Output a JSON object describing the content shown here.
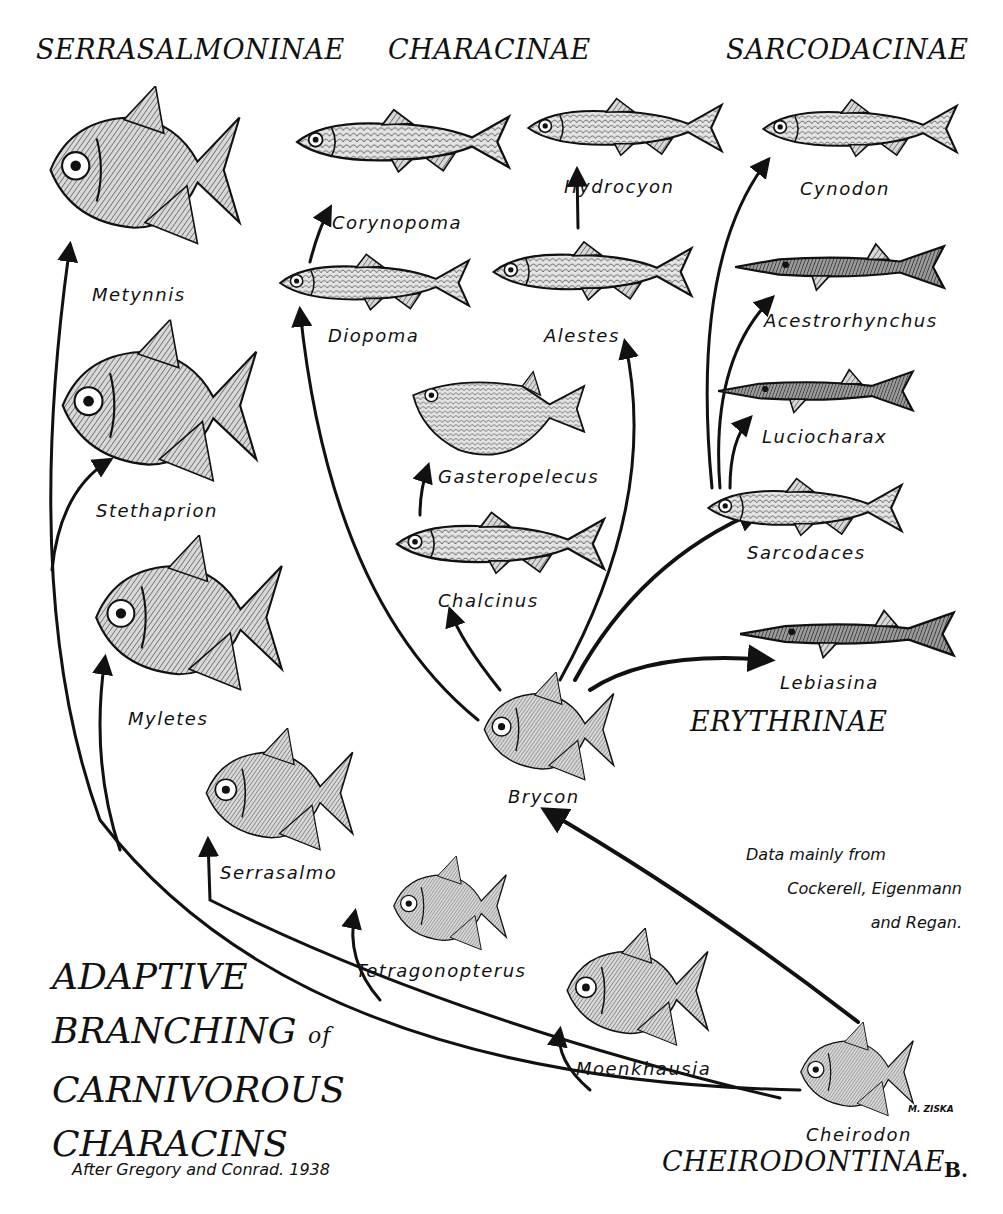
{
  "title": {
    "lines": [
      "ADAPTIVE",
      "BRANCHING",
      "of",
      "CARNIVOROUS",
      "CHARACINS"
    ],
    "credit": "After Gregory and Conrad. 1938"
  },
  "source_note": [
    "Data mainly from",
    "Cockerell, Eigenmann",
    "and Regan."
  ],
  "subfamilies": {
    "serrasalmoninae": "SERRASALMONINAE",
    "characinae": "CHARACINAE",
    "sarcodacinae": "SARCODACINAE",
    "erythrinae": "ERYTHRINAE",
    "cheirodontinae": "CHEIRODONTINAE"
  },
  "genera": {
    "metynnis": "Metynnis",
    "stethaprion": "Stethaprion",
    "myletes": "Myletes",
    "serrasalmo": "Serrasalmo",
    "corynopoma": "Corynopoma",
    "diopoma": "Diopoma",
    "hydrocyon": "Hydrocyon",
    "alestes": "Alestes",
    "gasteropelecus": "Gasteropelecus",
    "chalcinus": "Chalcinus",
    "brycon": "Brycon",
    "cynodon": "Cynodon",
    "acestrorhynchus": "Acestrorhynchus",
    "luciocharax": "Luciocharax",
    "sarcodaces": "Sarcodaces",
    "lebiasina": "Lebiasina",
    "tetragonopterus": "Tetragonopterus",
    "moenkhausia": "Moenkhausia",
    "cheirodon": "Cheirodon"
  },
  "artist_signature": "M. ZISKA",
  "plate_mark": "B.",
  "colors": {
    "ink": "#111111",
    "paper": "#ffffff",
    "fish_fill": "#cfcfcf",
    "fish_dark": "#555555"
  }
}
